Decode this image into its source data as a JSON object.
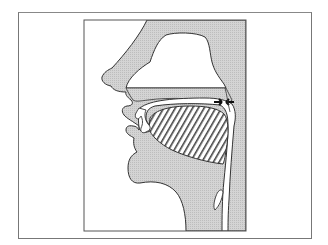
{
  "diagram": {
    "title": "",
    "type": "mid-sagittal vocal tract cross-section",
    "colors": {
      "tissue_fill": "#cfcfcf",
      "outline": "#333333",
      "background": "#ffffff",
      "frame": "#777777",
      "hatch": "#444444"
    },
    "parts": [
      {
        "id": "nose",
        "label": ""
      },
      {
        "id": "nasal-cavity",
        "label": ""
      },
      {
        "id": "hard-palate",
        "label": ""
      },
      {
        "id": "velum",
        "label": ""
      },
      {
        "id": "velic-closure-arrows",
        "label": ""
      },
      {
        "id": "upper-lip",
        "label": ""
      },
      {
        "id": "lower-lip",
        "label": ""
      },
      {
        "id": "tongue",
        "label": ""
      },
      {
        "id": "oral-cavity",
        "label": ""
      },
      {
        "id": "pharynx",
        "label": ""
      },
      {
        "id": "epiglottis",
        "label": ""
      },
      {
        "id": "chin-and-neck",
        "label": ""
      }
    ]
  }
}
